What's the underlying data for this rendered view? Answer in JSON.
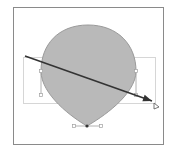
{
  "canvas": {
    "width": 170,
    "height": 157,
    "background": "#ffffff"
  },
  "artboard": {
    "x": 13,
    "y": 7,
    "width": 150,
    "height": 137,
    "stroke": "#8a8a8a"
  },
  "shape": {
    "type": "teardrop",
    "fill": "#b9b9b9",
    "stroke": "#9a9a9a",
    "top": [
      88,
      25
    ],
    "bottom": [
      87,
      126
    ],
    "left": [
      41,
      71
    ],
    "right": [
      136,
      71
    ]
  },
  "bounding_box": {
    "x": 23,
    "y": 57,
    "width": 132,
    "height": 46,
    "stroke": "#d6d6d6"
  },
  "handles": {
    "color": "#a0a0a0",
    "left_handle": [
      [
        41,
        71
      ],
      [
        41,
        95
      ]
    ],
    "right_handle": [
      [
        136,
        71
      ],
      [
        136,
        95
      ]
    ],
    "bottom_handle": [
      [
        74,
        126
      ],
      [
        101,
        126
      ]
    ]
  },
  "arrow": {
    "start": [
      25,
      56
    ],
    "end": [
      152,
      101
    ],
    "color": "#333333",
    "end_marker": [
      157,
      107
    ]
  }
}
